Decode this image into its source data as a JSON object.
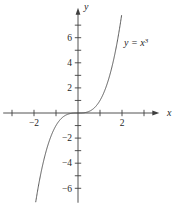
{
  "figure": {
    "background": "#ffffff",
    "axis_color": "#3f3f3f",
    "curve_color": "#4a4a4a",
    "text_color": "#1f1f1f"
  },
  "chart_data": {
    "type": "line",
    "title": "",
    "xlabel": "x",
    "ylabel": "y",
    "function_label": {
      "base": "y = x",
      "exponent": "3"
    },
    "xlim": [
      -3.4,
      3.65
    ],
    "ylim": [
      -7.15,
      8.3
    ],
    "grid": false,
    "legend": "none",
    "x_ticks": [
      -3,
      -2,
      -1,
      1,
      2,
      3
    ],
    "x_tick_labels": [
      {
        "value": -2,
        "label": "−2"
      },
      {
        "value": 2,
        "label": "2"
      }
    ],
    "y_ticks": [
      -6,
      -5,
      -4,
      -3,
      -2,
      -1,
      1,
      2,
      3,
      4,
      5,
      6,
      7
    ],
    "y_tick_labels": [
      {
        "value": 6,
        "label": "6"
      },
      {
        "value": 4,
        "label": "4"
      },
      {
        "value": 2,
        "label": "2"
      },
      {
        "value": -2,
        "label": "−2"
      },
      {
        "value": -4,
        "label": "−4"
      },
      {
        "value": -6,
        "label": "−6"
      }
    ],
    "series": [
      {
        "name": "y = x^3",
        "equation": "y = x^3",
        "drawn_domain": [
          -1.92,
          1.985
        ],
        "sample_points": [
          {
            "x": -2,
            "y": -8
          },
          {
            "x": -1.5,
            "y": -3.375
          },
          {
            "x": -1,
            "y": -1
          },
          {
            "x": -0.5,
            "y": -0.125
          },
          {
            "x": 0,
            "y": 0
          },
          {
            "x": 0.5,
            "y": 0.125
          },
          {
            "x": 1,
            "y": 1
          },
          {
            "x": 1.5,
            "y": 3.375
          },
          {
            "x": 2,
            "y": 8
          }
        ]
      }
    ]
  }
}
